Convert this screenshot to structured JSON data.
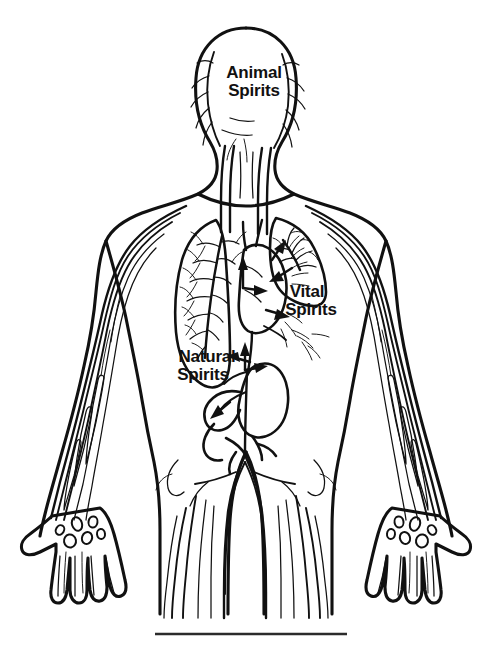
{
  "figure": {
    "background_color": "#ffffff",
    "ink_color": "#111111",
    "width": 491,
    "height": 647
  },
  "labels": [
    {
      "id": "animal-spirits",
      "line1": "Animal",
      "line2": "Spirits",
      "region": "head",
      "x": 254,
      "y": 78
    },
    {
      "id": "vital-spirits",
      "line1": "Vital",
      "line2": "Spirits",
      "region": "chest-heart-lungs",
      "x": 307,
      "y": 297
    },
    {
      "id": "natural-spirits",
      "line1": "Natural",
      "line2": "Spirits",
      "region": "abdomen-liver",
      "x": 207,
      "y": 362
    }
  ],
  "anatomy_parts": [
    "head",
    "neck-carotid-vessels",
    "left-lung-bronchial-tree",
    "right-lung-bronchial-tree",
    "heart",
    "liver-stomach",
    "intestines",
    "aorta",
    "iliac-bifurcation",
    "left-arm-veins",
    "right-arm-veins",
    "left-hand-carpal-bones",
    "right-hand-carpal-bones",
    "left-leg-vessels",
    "right-leg-vessels"
  ],
  "flow_arrows": [
    {
      "id": "arrow-heart-up",
      "from": "heart",
      "to": "lungs-left",
      "direction": "up"
    },
    {
      "id": "arrow-heart-right",
      "from": "heart",
      "to": "lung-right",
      "direction": "right"
    },
    {
      "id": "arrow-heart-inflow",
      "from": "lungs",
      "to": "heart",
      "direction": "down-left"
    },
    {
      "id": "arrow-heart-outflow",
      "from": "heart",
      "to": "body",
      "direction": "right"
    },
    {
      "id": "arrow-liver-up",
      "from": "liver",
      "to": "heart",
      "direction": "up"
    },
    {
      "id": "arrow-liver-right",
      "from": "liver",
      "to": "stomach",
      "direction": "right"
    },
    {
      "id": "arrow-liver-left",
      "from": "gut",
      "to": "liver",
      "direction": "left"
    },
    {
      "id": "arrow-gut-down",
      "from": "liver",
      "to": "gut",
      "direction": "down-left"
    }
  ],
  "caption_rule": {
    "visible": true,
    "x1": 155,
    "x2": 347,
    "y": 634
  }
}
